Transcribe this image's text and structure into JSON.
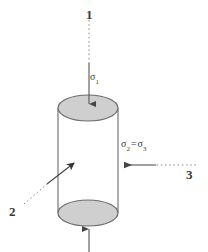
{
  "figure": {
    "shape": {
      "name": "cylinder",
      "fill_color": "#cfcfcf",
      "stroke_color": "#666666",
      "left_x": 58,
      "right_x": 118,
      "top_center_y": 108,
      "bottom_center_y": 213,
      "ellipse_rx": 30,
      "ellipse_ry": 13
    },
    "callouts": [
      {
        "id": "1",
        "label": "1",
        "description": "axial loading direction leader",
        "x": 86,
        "y": 8
      },
      {
        "id": "2",
        "label": "2",
        "description": "cylindrical specimen leader",
        "x": 9,
        "y": 205
      },
      {
        "id": "3",
        "label": "3",
        "description": "confining pressure leader",
        "x": 186,
        "y": 168
      }
    ],
    "stress_labels": [
      {
        "id": "sigma1",
        "symbol": "σ",
        "subscript": "1",
        "text": "σ1",
        "x": 90,
        "y": 72
      },
      {
        "id": "sigma23",
        "symbol_left": "σ",
        "subscript_left": "2",
        "equals": "=",
        "symbol_right": "σ",
        "subscript_right": "3",
        "text": "σ2 = σ3",
        "x": 121,
        "y": 139
      }
    ],
    "arrows": [
      {
        "name": "axial-stress-arrow-top",
        "direction": "down",
        "dashed_from_y": 20,
        "dashed_to_y": 63,
        "solid_from_y": 63,
        "tip_y": 110,
        "x": 89
      },
      {
        "name": "axial-stress-arrow-bottom",
        "direction": "up",
        "solid_from_y": 250,
        "tip_y": 222,
        "x": 89
      },
      {
        "name": "confining-stress-arrow",
        "direction": "left",
        "dashed_from_x": 195,
        "dashed_to_x": 155,
        "solid_from_x": 155,
        "tip_x": 120,
        "y": 165
      },
      {
        "name": "specimen-leader-arrow",
        "direction": "up-right",
        "dashed_from": [
          25,
          205
        ],
        "dashed_to": [
          46,
          185
        ],
        "solid_from": [
          46,
          185
        ],
        "tip": [
          78,
          160
        ]
      }
    ],
    "colors": {
      "line": "#555555",
      "cylinder_fill": "#cfcfcf",
      "cylinder_stroke": "#666666",
      "text": "#3a3a3a",
      "background": "#ffffff"
    }
  }
}
